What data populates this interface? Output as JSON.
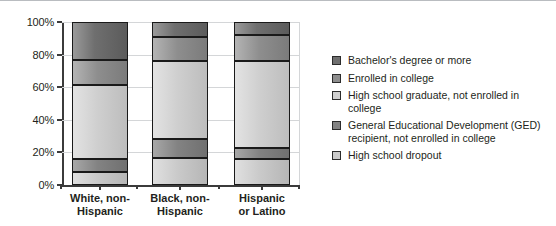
{
  "chart_data": {
    "type": "bar",
    "subtype": "stacked-bar-100",
    "title": "",
    "xlabel": "",
    "ylabel": "Percent",
    "ylim": [
      0,
      100
    ],
    "yticks": [
      "0%",
      "20%",
      "40%",
      "60%",
      "80%",
      "100%"
    ],
    "ytick_values": [
      0,
      20,
      40,
      60,
      80,
      100
    ],
    "grid": true,
    "legend_position": "right",
    "categories": [
      "White, non-Hispanic",
      "Black, non-Hispanic",
      "Hispanic or Latino"
    ],
    "series": [
      {
        "name": "Bachelor's degree or more",
        "color": "#6f6f6f",
        "values": [
          23.0,
          9.0,
          8.0
        ]
      },
      {
        "name": "Enrolled in college",
        "color": "#8e8e8e",
        "values": [
          15.5,
          15.0,
          16.0
        ]
      },
      {
        "name": "High school graduate, not enrolled in college",
        "color": "#cfcfcf",
        "values": [
          45.5,
          48.0,
          53.0
        ]
      },
      {
        "name": "General Educational Development (GED) recipient, not enrolled in college",
        "color": "#838383",
        "values": [
          8.0,
          11.5,
          7.0
        ]
      },
      {
        "name": "High school dropout",
        "color": "#cacaca",
        "values": [
          8.0,
          16.5,
          16.0
        ]
      }
    ]
  },
  "axis": {
    "y_title": "Percent",
    "ticks": [
      {
        "label": "100%",
        "value": 100
      },
      {
        "label": "80%",
        "value": 80
      },
      {
        "label": "60%",
        "value": 60
      },
      {
        "label": "40%",
        "value": 40
      },
      {
        "label": "20%",
        "value": 20
      },
      {
        "label": "0%",
        "value": 0
      }
    ]
  },
  "categories": [
    {
      "line1": "White, non-",
      "line2": "Hispanic"
    },
    {
      "line1": "Black, non-",
      "line2": "Hispanic"
    },
    {
      "line1": "Hispanic",
      "line2": "or Latino"
    }
  ],
  "legend": {
    "items": [
      {
        "label": "Bachelor's degree or more",
        "swatch": "#6f6f6f"
      },
      {
        "label": "Enrolled in college",
        "swatch": "#8e8e8e"
      },
      {
        "label": "High school graduate, not enrolled in college",
        "swatch": "#cfcfcf"
      },
      {
        "label": "General Educational Development (GED)\nrecipient, not enrolled in college",
        "swatch": "#838383"
      },
      {
        "label": "High school dropout",
        "swatch": "#cacaca"
      }
    ]
  }
}
